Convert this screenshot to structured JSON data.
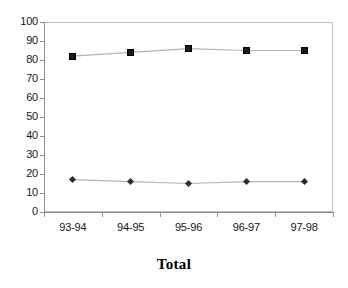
{
  "chart_data": {
    "type": "line",
    "title": "Total",
    "xlabel": "",
    "ylabel": "",
    "categories": [
      "93-94",
      "94-95",
      "95-96",
      "96-97",
      "97-98"
    ],
    "series": [
      {
        "name": "upper-series",
        "marker": "square",
        "color": "#1a1a1a",
        "values": [
          82,
          84,
          86,
          85,
          85
        ]
      },
      {
        "name": "lower-series",
        "marker": "diamond",
        "color": "#2b2b38",
        "values": [
          17,
          16,
          15,
          16,
          16
        ]
      }
    ],
    "ylim": [
      0,
      100
    ],
    "ytick_values": [
      0,
      10,
      20,
      30,
      40,
      50,
      60,
      70,
      80,
      90,
      100
    ],
    "ytick_labels": [
      "0",
      "10",
      "20",
      "30",
      "40",
      "50",
      "60",
      "70",
      "80",
      "90",
      "100"
    ],
    "grid": false,
    "legend": false,
    "line_color": "#b5b5b5",
    "axis_color": "#8d8d8d",
    "frame_color": "#b9b9b9",
    "background": "#ffffff"
  }
}
